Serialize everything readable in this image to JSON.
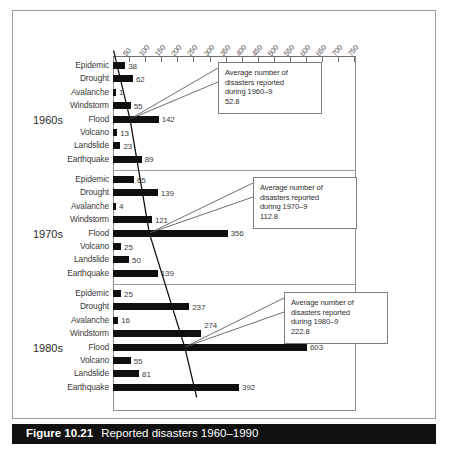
{
  "figure": {
    "number": "Figure 10.21",
    "title": "Reported disasters 1960–1990"
  },
  "chart_data": {
    "type": "bar",
    "orientation": "horizontal",
    "title": "Reported disasters 1960–1990",
    "xlabel": "",
    "ylabel": "",
    "xlim": [
      0,
      775
    ],
    "grid": false,
    "axis_position": "top",
    "tick_labels": [
      "50",
      "100",
      "150",
      "200",
      "250",
      "300",
      "350",
      "400",
      "450",
      "500",
      "550",
      "600",
      "650",
      "700",
      "750"
    ],
    "tick_values": [
      50,
      100,
      150,
      200,
      250,
      300,
      350,
      400,
      450,
      500,
      550,
      600,
      650,
      700,
      750
    ],
    "categories": [
      "Epidemic",
      "Drought",
      "Avalanche",
      "Windstorm",
      "Flood",
      "Volcano",
      "Landslide",
      "Earthquake"
    ],
    "groups": [
      {
        "name": "1960s",
        "values": [
          38,
          62,
          1,
          55,
          142,
          13,
          23,
          89
        ],
        "average": 52.8
      },
      {
        "name": "1970s",
        "values": [
          65,
          139,
          4,
          121,
          356,
          25,
          50,
          139
        ],
        "average": 112.8
      },
      {
        "name": "1980s",
        "values": [
          25,
          237,
          16,
          274,
          603,
          55,
          81,
          392
        ],
        "average": 222.8
      }
    ],
    "annotations": [
      {
        "lines": [
          "Average number of",
          "disasters reported",
          "during 1960–9",
          "52.8"
        ],
        "value": 52.8,
        "group": "1960s"
      },
      {
        "lines": [
          "Average number of",
          "disasters reported",
          "during 1970–9",
          "112.8"
        ],
        "value": 112.8,
        "group": "1970s"
      },
      {
        "lines": [
          "Average number of",
          "disasters reported",
          "during 1980–9",
          "222.8"
        ],
        "value": 222.8,
        "group": "1980s"
      }
    ],
    "trend_line": {
      "description": "line connecting decade averages",
      "points": [
        52.8,
        112.8,
        222.8
      ]
    }
  },
  "colors": {
    "bar": "#0f0f0f",
    "axis": "#6f6f6f",
    "caption_bar": "#111111",
    "caption_text": "#ffffff",
    "frame": "#9a9a9a"
  }
}
